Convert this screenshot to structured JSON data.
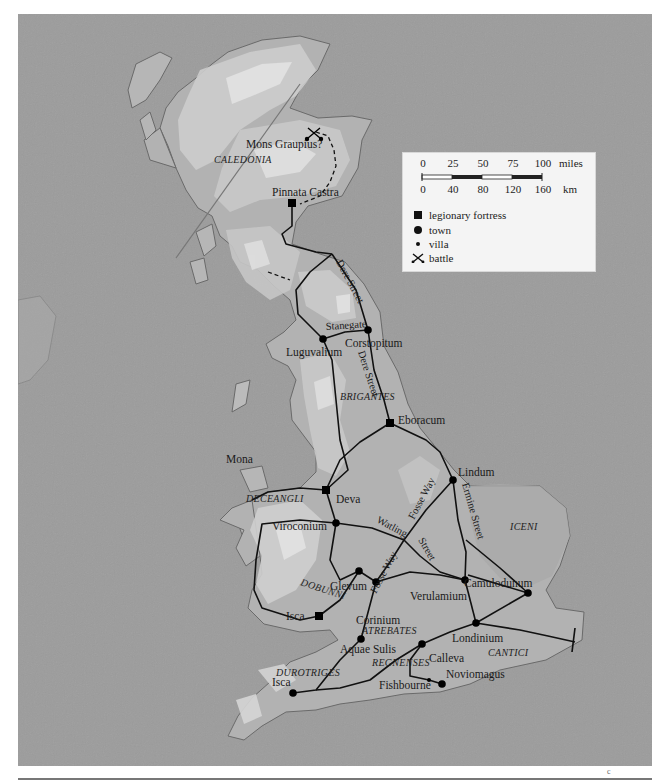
{
  "map": {
    "title": "Roman Britain",
    "regions": [
      {
        "name": "CALEDONIA",
        "x": 214,
        "y": 163
      },
      {
        "name": "BRIGANTES",
        "x": 340,
        "y": 397
      },
      {
        "name": "DECEANGLI",
        "x": 244,
        "y": 500
      },
      {
        "name": "DOBUNNI",
        "x": 298,
        "y": 583
      },
      {
        "name": "ICENI",
        "x": 510,
        "y": 528
      },
      {
        "name": "ATREBATES",
        "x": 362,
        "y": 631
      },
      {
        "name": "REGNENSES",
        "x": 371,
        "y": 663
      },
      {
        "name": "DUROTRIGES",
        "x": 276,
        "y": 673
      },
      {
        "name": "CANTICI",
        "x": 488,
        "y": 653
      }
    ],
    "places": [
      {
        "name": "Mons Graupius?",
        "type": "battle",
        "x": 314,
        "y": 134,
        "lx": 246,
        "ly": 148
      },
      {
        "name": "Pinnata Castra",
        "type": "legionary fortress",
        "x": 292,
        "y": 203,
        "lx": 272,
        "ly": 192
      },
      {
        "name": "Luguvalium",
        "type": "town",
        "x": 323,
        "y": 339,
        "lx": 286,
        "ly": 357
      },
      {
        "name": "Corstopitum",
        "type": "town",
        "x": 368,
        "y": 330,
        "lx": 345,
        "ly": 345
      },
      {
        "name": "Eboracum",
        "type": "legionary fortress",
        "x": 390,
        "y": 423,
        "lx": 398,
        "ly": 418
      },
      {
        "name": "Mona",
        "type": "island",
        "x": 0,
        "y": 0,
        "lx": 226,
        "ly": 463
      },
      {
        "name": "Deva",
        "type": "legionary fortress",
        "x": 326,
        "y": 490,
        "lx": 336,
        "ly": 502
      },
      {
        "name": "Lindum",
        "type": "town",
        "x": 453,
        "y": 480,
        "lx": 458,
        "ly": 474
      },
      {
        "name": "Viroconium",
        "type": "town",
        "x": 336,
        "y": 523,
        "lx": 272,
        "ly": 530
      },
      {
        "name": "Glevum",
        "type": "town",
        "x": 359,
        "y": 571,
        "lx": 330,
        "ly": 589
      },
      {
        "name": "Isca",
        "type": "legionary fortress",
        "x": 319,
        "y": 616,
        "lx": 286,
        "ly": 617
      },
      {
        "name": "Corinium",
        "type": "town",
        "x": 376,
        "y": 582,
        "lx": 356,
        "ly": 624
      },
      {
        "name": "Verulamium",
        "type": "town",
        "x": 465,
        "y": 580,
        "lx": 410,
        "ly": 599
      },
      {
        "name": "Camulodunum",
        "type": "town",
        "x": 528,
        "y": 593,
        "lx": 464,
        "ly": 585
      },
      {
        "name": "Londinium",
        "type": "town",
        "x": 476,
        "y": 623,
        "lx": 452,
        "ly": 641
      },
      {
        "name": "Aquae Sulis",
        "type": "town",
        "x": 361,
        "y": 639,
        "lx": 340,
        "ly": 652
      },
      {
        "name": "Calleva",
        "type": "town",
        "x": 422,
        "y": 644,
        "lx": 429,
        "ly": 661
      },
      {
        "name": "Noviomagus",
        "type": "town",
        "x": 442,
        "y": 684,
        "lx": 446,
        "ly": 677
      },
      {
        "name": "Fishbourne",
        "type": "villa",
        "x": 429,
        "y": 680,
        "lx": 379,
        "ly": 688
      },
      {
        "name": "Isca",
        "type": "town",
        "x": 293,
        "y": 693,
        "lx": 272,
        "ly": 686
      }
    ],
    "roads": [
      {
        "name": "Dere Street",
        "lx": 336,
        "ly": 262,
        "angle": 62
      },
      {
        "name": "Stanegate",
        "lx": 337,
        "ly": 330,
        "angle": -4
      },
      {
        "name": "Dere Street",
        "lx": 359,
        "ly": 355,
        "angle": 72
      },
      {
        "name": "Fosse Way",
        "lx": 426,
        "ly": 504,
        "angle": -62
      },
      {
        "name": "Ermine Street",
        "lx": 463,
        "ly": 484,
        "angle": 74
      },
      {
        "name": "Watling",
        "lx": 377,
        "ly": 523,
        "angle": 28
      },
      {
        "name": "Street",
        "lx": 422,
        "ly": 542,
        "angle": 60
      },
      {
        "name": "Fosse Way",
        "lx": 373,
        "ly": 587,
        "angle": -62
      }
    ]
  },
  "legend": {
    "scale": {
      "miles_ticks": [
        "0",
        "25",
        "50",
        "75",
        "100"
      ],
      "miles_unit": "miles",
      "km_ticks": [
        "0",
        "40",
        "80",
        "120",
        "160"
      ],
      "km_unit": "km"
    },
    "items": [
      {
        "symbol": "square",
        "label": "legionary fortress"
      },
      {
        "symbol": "circle",
        "label": "town"
      },
      {
        "symbol": "dot",
        "label": "villa"
      },
      {
        "symbol": "crossed-swords",
        "label": "battle"
      }
    ]
  },
  "footer": {
    "page_mark": "c"
  },
  "colors": {
    "sea": "#9a9a9a",
    "land": "#b5b5b5",
    "highland": "#d2d2d2",
    "peak": "#e8e8e8",
    "road": "#111111",
    "legend_bg": "#f4f4f4"
  }
}
